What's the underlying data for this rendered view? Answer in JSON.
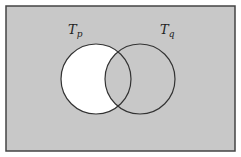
{
  "diagram": {
    "type": "venn",
    "background_color": "#c8c8c8",
    "highlight_color": "#ffffff",
    "stroke_color": "#333333",
    "universe": {
      "x": 6,
      "y": 6,
      "width": 229,
      "height": 145
    },
    "sets": [
      {
        "id": "p",
        "label_main": "T",
        "label_sub": "p",
        "cx": 96,
        "cy": 79,
        "r": 35,
        "label_x": 68,
        "label_y": 34
      },
      {
        "id": "q",
        "label_main": "T",
        "label_sub": "q",
        "cx": 140,
        "cy": 79,
        "r": 35,
        "label_x": 160,
        "label_y": 34
      }
    ],
    "shaded_region": "T_p minus T_q (shown white)"
  }
}
